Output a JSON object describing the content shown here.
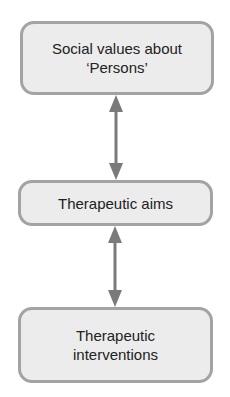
{
  "diagram": {
    "type": "flow",
    "nodes": [
      {
        "id": "social-values",
        "label": "Social values about\n‘Persons’"
      },
      {
        "id": "therapeutic-aims",
        "label": "Therapeutic aims"
      },
      {
        "id": "therapeutic-interventions",
        "label": "Therapeutic\ninterventions"
      }
    ],
    "edges": [
      {
        "from": "social-values",
        "to": "therapeutic-aims",
        "direction": "bidirectional"
      },
      {
        "from": "therapeutic-aims",
        "to": "therapeutic-interventions",
        "direction": "bidirectional"
      }
    ],
    "colors": {
      "node_fill": "#ececec",
      "node_border": "#a3a3a3",
      "arrow": "#7a7a7a",
      "text": "#222222"
    }
  }
}
